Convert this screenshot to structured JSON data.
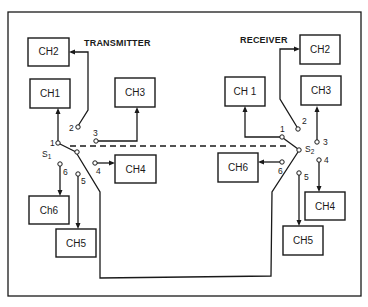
{
  "diagram": {
    "transmitter": {
      "title": "TRANSMITTER",
      "switch_label": "S",
      "switch_sub": "1",
      "channels": {
        "ch1": "CH1",
        "ch2": "CH2",
        "ch3": "CH3",
        "ch4": "CH4",
        "ch5": "CH5",
        "ch6": "Ch6"
      },
      "terminals": [
        "1",
        "2",
        "3",
        "4",
        "5",
        "6"
      ]
    },
    "receiver": {
      "title": "RECEIVER",
      "switch_label": "S",
      "switch_sub": "2",
      "channels": {
        "ch1": "CH 1",
        "ch2": "CH2",
        "ch3": "CH3",
        "ch4": "CH4",
        "ch5": "CH5",
        "ch6": "CH6"
      },
      "terminals": [
        "1",
        "2",
        "3",
        "4",
        "5",
        "6"
      ]
    },
    "colors": {
      "line": "#1a1a1a",
      "background": "#ffffff"
    }
  }
}
